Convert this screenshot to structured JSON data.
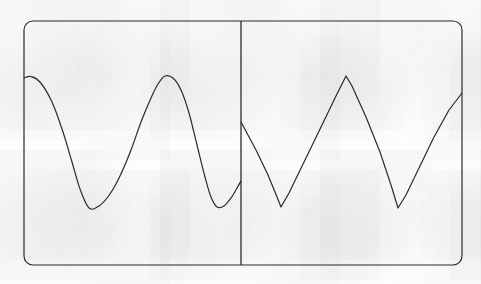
{
  "figure": {
    "name": "two-panel-waveform-sketch",
    "canvas": {
      "width": 481,
      "height": 284
    },
    "background_color": "#fdfdfb",
    "stroke_color": "#2b2b2b",
    "frame": {
      "name": "rounded-rectangle-frame",
      "x": 24,
      "y": 21,
      "width": 438,
      "height": 244,
      "corner_radius": 9,
      "stroke_width": 1.2
    },
    "divider": {
      "name": "vertical-divider",
      "x": 241,
      "y_top": 21,
      "y_bottom": 265,
      "stroke_width": 1.3
    }
  },
  "chart_data": {
    "type": "line",
    "title": "",
    "subtitle": "",
    "xlabel": "",
    "ylabel": "",
    "grid": false,
    "legend": "none",
    "axis_ranges": {
      "panel_left": {
        "xlim": [
          24,
          241
        ],
        "ylim": [
          21,
          265
        ]
      },
      "panel_right": {
        "xlim": [
          241,
          462
        ],
        "ylim": [
          21,
          265
        ]
      }
    },
    "note": "Hand-drawn style waveform comparison. Left panel: smooth sinusoid. Right panel: sharp sawtooth/triangle wave. Coordinates are in screen pixels; y increases downward.",
    "series": [
      {
        "name": "smooth-sine-wave",
        "panel": "left",
        "shape": "smooth",
        "stroke_width": 1.2,
        "points": [
          {
            "x": 24,
            "y": 78
          },
          {
            "x": 31,
            "y": 76.5
          },
          {
            "x": 40,
            "y": 82
          },
          {
            "x": 52,
            "y": 102
          },
          {
            "x": 63,
            "y": 132
          },
          {
            "x": 72,
            "y": 162
          },
          {
            "x": 80,
            "y": 189
          },
          {
            "x": 89,
            "y": 208
          },
          {
            "x": 99,
            "y": 206
          },
          {
            "x": 110,
            "y": 194
          },
          {
            "x": 120,
            "y": 176
          },
          {
            "x": 131,
            "y": 150
          },
          {
            "x": 141,
            "y": 122
          },
          {
            "x": 151,
            "y": 98
          },
          {
            "x": 158,
            "y": 84
          },
          {
            "x": 165,
            "y": 76
          },
          {
            "x": 173,
            "y": 78
          },
          {
            "x": 181,
            "y": 90
          },
          {
            "x": 189,
            "y": 113
          },
          {
            "x": 197,
            "y": 145
          },
          {
            "x": 205,
            "y": 177
          },
          {
            "x": 211,
            "y": 197
          },
          {
            "x": 217,
            "y": 207
          },
          {
            "x": 224,
            "y": 206
          },
          {
            "x": 231,
            "y": 198
          },
          {
            "x": 237,
            "y": 188
          },
          {
            "x": 241,
            "y": 181
          }
        ]
      },
      {
        "name": "sharp-triangle-wave",
        "panel": "right",
        "shape": "angular",
        "stroke_width": 1.2,
        "points": [
          {
            "x": 241,
            "y": 122
          },
          {
            "x": 256,
            "y": 150
          },
          {
            "x": 268,
            "y": 175
          },
          {
            "x": 275,
            "y": 192
          },
          {
            "x": 281,
            "y": 207
          },
          {
            "x": 289,
            "y": 193
          },
          {
            "x": 305,
            "y": 160
          },
          {
            "x": 322,
            "y": 125
          },
          {
            "x": 336,
            "y": 96
          },
          {
            "x": 346,
            "y": 76
          },
          {
            "x": 352,
            "y": 86
          },
          {
            "x": 366,
            "y": 117
          },
          {
            "x": 380,
            "y": 152
          },
          {
            "x": 391,
            "y": 185
          },
          {
            "x": 398,
            "y": 208
          },
          {
            "x": 406,
            "y": 195
          },
          {
            "x": 419,
            "y": 168
          },
          {
            "x": 434,
            "y": 137
          },
          {
            "x": 449,
            "y": 110
          },
          {
            "x": 462,
            "y": 93
          }
        ]
      }
    ]
  }
}
